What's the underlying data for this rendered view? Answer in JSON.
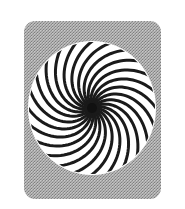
{
  "figure": {
    "background_color": "#ffffff",
    "panel_color": "#a8a8a8",
    "disc_color": "#ffffff",
    "arm_color": "#1a1a1a",
    "arm_count": 24,
    "rotation": "clockwise"
  }
}
